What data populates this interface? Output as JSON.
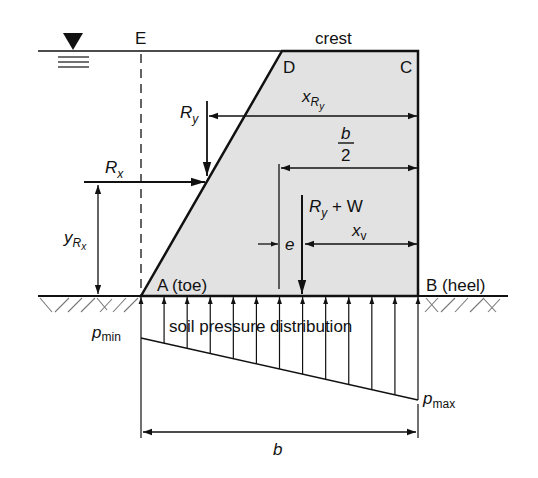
{
  "figure": {
    "type": "gravity dam free-body diagram",
    "colors": {
      "line": "#111111",
      "dam_fill": "#e2e2e2",
      "background": "#ffffff"
    },
    "labels": {
      "water_surface_symbol": "water-surface-symbol",
      "point_E": "E",
      "crest": "crest",
      "point_D": "D",
      "point_C": "C",
      "point_A": "A (toe)",
      "point_B": "B (heel)",
      "force_Ry": {
        "main": "R",
        "sub": "y"
      },
      "force_Rx": {
        "main": "R",
        "sub": "x"
      },
      "dim_xRy": {
        "main": "x",
        "sub": "R",
        "subsub": "y"
      },
      "dim_yRx": {
        "main": "y",
        "sub": "R",
        "subsub": "x"
      },
      "dim_b_half": {
        "numerator": "b",
        "denominator": "2"
      },
      "force_RyW": {
        "main": "R",
        "sub": "y",
        "rest": " + W"
      },
      "dim_e": "e",
      "dim_xv": {
        "main": "x",
        "sub": "v"
      },
      "pressure_caption": "soil pressure distribution",
      "p_min": {
        "main": "p",
        "sub": "min"
      },
      "p_max": {
        "main": "p",
        "sub": "max"
      },
      "dim_b": "b"
    },
    "soil_pressure": {
      "arrow_count": 13,
      "relative_magnitude_min": 0.0,
      "relative_magnitude_max": 1.0
    }
  }
}
